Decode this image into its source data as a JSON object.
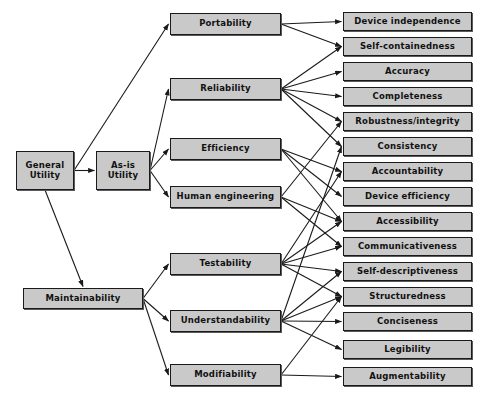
{
  "diagram": {
    "colors": {
      "node_fill": "#c9c9c9",
      "node_border": "#1a1a1a",
      "node_shadow": "#5a5a5a",
      "edge": "#1a1a1a",
      "background": "#ffffff"
    },
    "levels": {
      "root_label": "General Utility",
      "level2_label": "Intermediate constructs",
      "level3_label": "Primitive constructs",
      "leaf_label": "Metrics"
    },
    "nodes": [
      {
        "id": "general-utility",
        "label": "General\nUtility",
        "level": "root",
        "x": 16,
        "y": 151,
        "w": 58,
        "h": 39
      },
      {
        "id": "as-is-utility",
        "label": "As-is\nUtility",
        "level": "level2",
        "x": 96,
        "y": 151,
        "w": 54,
        "h": 39
      },
      {
        "id": "maintainability",
        "label": "Maintainability",
        "level": "level2",
        "x": 23,
        "y": 288,
        "w": 120,
        "h": 21
      },
      {
        "id": "portability",
        "label": "Portability",
        "level": "level3",
        "x": 170,
        "y": 13,
        "w": 111,
        "h": 22
      },
      {
        "id": "reliability",
        "label": "Reliability",
        "level": "level3",
        "x": 170,
        "y": 78,
        "w": 111,
        "h": 22
      },
      {
        "id": "efficiency",
        "label": "Efficiency",
        "level": "level3",
        "x": 170,
        "y": 138,
        "w": 111,
        "h": 22
      },
      {
        "id": "human-engineering",
        "label": "Human engineering",
        "level": "level3",
        "x": 170,
        "y": 186,
        "w": 111,
        "h": 22
      },
      {
        "id": "testability",
        "label": "Testability",
        "level": "level3",
        "x": 170,
        "y": 253,
        "w": 111,
        "h": 22
      },
      {
        "id": "understandability",
        "label": "Understandability",
        "level": "level3",
        "x": 170,
        "y": 310,
        "w": 111,
        "h": 22
      },
      {
        "id": "modifiability",
        "label": "Modifiability",
        "level": "level3",
        "x": 170,
        "y": 364,
        "w": 111,
        "h": 22
      },
      {
        "id": "device-independence",
        "label": "Device independence",
        "level": "leaf",
        "x": 343,
        "y": 12,
        "w": 129,
        "h": 19
      },
      {
        "id": "self-containedness",
        "label": "Self-containedness",
        "level": "leaf",
        "x": 343,
        "y": 37,
        "w": 129,
        "h": 19
      },
      {
        "id": "accuracy",
        "label": "Accuracy",
        "level": "leaf",
        "x": 343,
        "y": 62,
        "w": 129,
        "h": 19
      },
      {
        "id": "completeness",
        "label": "Completeness",
        "level": "leaf",
        "x": 343,
        "y": 87,
        "w": 129,
        "h": 19
      },
      {
        "id": "robustness-integrity",
        "label": "Robustness/integrity",
        "level": "leaf",
        "x": 343,
        "y": 112,
        "w": 129,
        "h": 19
      },
      {
        "id": "consistency",
        "label": "Consistency",
        "level": "leaf",
        "x": 343,
        "y": 137,
        "w": 129,
        "h": 19
      },
      {
        "id": "accountability",
        "label": "Accountability",
        "level": "leaf",
        "x": 343,
        "y": 162,
        "w": 129,
        "h": 19
      },
      {
        "id": "device-efficiency",
        "label": "Device efficiency",
        "level": "leaf",
        "x": 343,
        "y": 187,
        "w": 129,
        "h": 19
      },
      {
        "id": "accessibility",
        "label": "Accessibility",
        "level": "leaf",
        "x": 343,
        "y": 212,
        "w": 129,
        "h": 19
      },
      {
        "id": "communicativeness",
        "label": "Communicativeness",
        "level": "leaf",
        "x": 343,
        "y": 237,
        "w": 129,
        "h": 19
      },
      {
        "id": "self-descriptiveness",
        "label": "Self-descriptiveness",
        "level": "leaf",
        "x": 343,
        "y": 262,
        "w": 129,
        "h": 19
      },
      {
        "id": "structuredness",
        "label": "Structuredness",
        "level": "leaf",
        "x": 343,
        "y": 287,
        "w": 129,
        "h": 19
      },
      {
        "id": "conciseness",
        "label": "Conciseness",
        "level": "leaf",
        "x": 343,
        "y": 312,
        "w": 129,
        "h": 19
      },
      {
        "id": "legibility",
        "label": "Legibility",
        "level": "leaf",
        "x": 343,
        "y": 340,
        "w": 129,
        "h": 19
      },
      {
        "id": "augmentability",
        "label": "Augmentability",
        "level": "leaf",
        "x": 343,
        "y": 367,
        "w": 129,
        "h": 19
      }
    ],
    "edges": [
      {
        "from": "general-utility",
        "to": "as-is-utility"
      },
      {
        "from": "general-utility",
        "to": "portability"
      },
      {
        "from": "general-utility",
        "to": "maintainability"
      },
      {
        "from": "as-is-utility",
        "to": "reliability"
      },
      {
        "from": "as-is-utility",
        "to": "efficiency"
      },
      {
        "from": "as-is-utility",
        "to": "human-engineering"
      },
      {
        "from": "maintainability",
        "to": "testability"
      },
      {
        "from": "maintainability",
        "to": "understandability"
      },
      {
        "from": "maintainability",
        "to": "modifiability"
      },
      {
        "from": "portability",
        "to": "device-independence"
      },
      {
        "from": "portability",
        "to": "self-containedness"
      },
      {
        "from": "reliability",
        "to": "self-containedness"
      },
      {
        "from": "reliability",
        "to": "accuracy"
      },
      {
        "from": "reliability",
        "to": "completeness"
      },
      {
        "from": "reliability",
        "to": "robustness-integrity"
      },
      {
        "from": "reliability",
        "to": "consistency"
      },
      {
        "from": "efficiency",
        "to": "accountability"
      },
      {
        "from": "efficiency",
        "to": "device-efficiency"
      },
      {
        "from": "efficiency",
        "to": "accessibility"
      },
      {
        "from": "human-engineering",
        "to": "accessibility"
      },
      {
        "from": "human-engineering",
        "to": "communicativeness"
      },
      {
        "from": "human-engineering",
        "to": "robustness-integrity"
      },
      {
        "from": "testability",
        "to": "accountability"
      },
      {
        "from": "testability",
        "to": "accessibility"
      },
      {
        "from": "testability",
        "to": "communicativeness"
      },
      {
        "from": "testability",
        "to": "self-descriptiveness"
      },
      {
        "from": "testability",
        "to": "structuredness"
      },
      {
        "from": "understandability",
        "to": "consistency"
      },
      {
        "from": "understandability",
        "to": "structuredness"
      },
      {
        "from": "understandability",
        "to": "conciseness"
      },
      {
        "from": "understandability",
        "to": "legibility"
      },
      {
        "from": "understandability",
        "to": "self-descriptiveness"
      },
      {
        "from": "modifiability",
        "to": "structuredness"
      },
      {
        "from": "modifiability",
        "to": "augmentability"
      }
    ]
  }
}
